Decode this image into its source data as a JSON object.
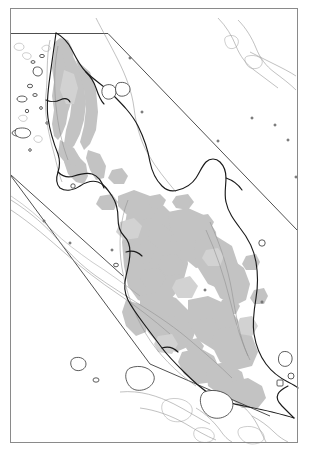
{
  "document": {
    "type": "map",
    "title": "Malay Peninsula outline map",
    "description": "Black-and-white line map of the Malay Peninsula showing coastlines, offshore islands, grey shaded interior highland/land-cover areas, and straight administrative/boundary lines, enclosed in a thin rectangular neatline frame.",
    "orientation": "north-up",
    "background_color": "#ffffff"
  },
  "style": {
    "frame_color": "#8a8a8a",
    "frame_width": 1,
    "coastline_color": "#1a1a1a",
    "coastline_width": 1.15,
    "inner_contour_color": "#8d8d8d",
    "inner_contour_width": 0.55,
    "boundary_line_color": "#3c3c3c",
    "boundary_line_width": 0.9,
    "shading_fill": "#c3c3c3",
    "shading_fill_light": "#d2d2d2",
    "island_fill": "#ffffff",
    "island_stroke": "#333333"
  },
  "frame": {
    "label": "map-neatline",
    "x": 10.5,
    "y": 8.5,
    "width": 287,
    "height": 434
  },
  "layers": [
    {
      "id": "neatline",
      "label": "Map frame / neatline",
      "visible": true
    },
    {
      "id": "boundary-lines",
      "label": "Straight boundary lines",
      "visible": true
    },
    {
      "id": "shading",
      "label": "Grey interior shading",
      "visible": true
    },
    {
      "id": "coastline",
      "label": "Mainland coastline",
      "visible": true
    },
    {
      "id": "inner-contours",
      "label": "Inner coastal contour lines",
      "visible": true
    },
    {
      "id": "islands",
      "label": "Offshore islands",
      "visible": true
    }
  ],
  "boundary_lines": [
    {
      "name": "northern-horizontal-boundary",
      "points": "11,33.5 108,33.5"
    },
    {
      "name": "north-east-diagonal-boundary",
      "points": "108,33.5 297,230"
    },
    {
      "name": "west-diagonal-boundary",
      "points": "11,175 123,276"
    },
    {
      "name": "south-west-diagonal-boundary",
      "points": "11,176 150,364 270,416"
    },
    {
      "name": "south-east-return-boundary",
      "points": "270,416 291,404 296,388"
    }
  ],
  "features": {
    "mainland_label": "Malay Peninsula mainland",
    "islands_label": "Offshore islands",
    "shading_label": "Shaded interior areas"
  }
}
